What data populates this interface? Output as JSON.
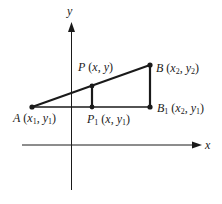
{
  "diagram": {
    "axes": {
      "x_label": "x",
      "y_label": "y"
    },
    "points": {
      "A": {
        "name": "A",
        "coords": "(x1, y1)",
        "x_sym": "x",
        "x_sub": "1",
        "y_sym": "y",
        "y_sub": "1"
      },
      "P": {
        "name": "P",
        "coords": "(x, y)",
        "x_sym": "x",
        "y_sym": "y"
      },
      "B": {
        "name": "B",
        "coords": "(x2, y2)",
        "x_sym": "x",
        "x_sub": "2",
        "y_sym": "y",
        "y_sub": "2"
      },
      "P1": {
        "name": "P",
        "name_sub": "1",
        "coords": "(x, y1)",
        "x_sym": "x",
        "y_sym": "y",
        "y_sub": "1"
      },
      "B1": {
        "name": "B",
        "name_sub": "1",
        "coords": "(x2, y1)",
        "x_sym": "x",
        "x_sub": "2",
        "y_sym": "y",
        "y_sub": "1"
      }
    },
    "punct": {
      "open": "(",
      "close": ")",
      "comma": ", "
    },
    "colors": {
      "stroke": "#1a1a1a",
      "background": "#ffffff"
    }
  }
}
